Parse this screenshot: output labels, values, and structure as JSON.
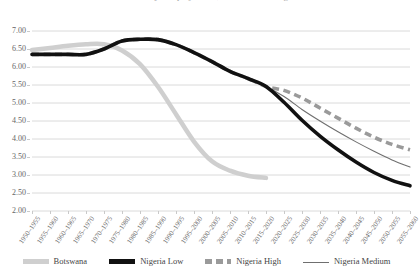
{
  "chart_data": {
    "type": "line",
    "title": "Total fertility rate projections, Botswana and Nigeria",
    "xlabel": "",
    "ylabel": "",
    "grid": true,
    "legend_position": "bottom",
    "ylim": [
      2.0,
      7.0
    ],
    "ytick_step": 0.5,
    "ytick_labels": [
      "7.00",
      "6.50",
      "6.00",
      "5.50",
      "5.00",
      "4.50",
      "4.00",
      "3.50",
      "3.00",
      "2.50",
      "2.00"
    ],
    "ytick_values": [
      7.0,
      6.5,
      6.0,
      5.5,
      5.0,
      4.5,
      4.0,
      3.5,
      3.0,
      2.5,
      2.0
    ],
    "categories": [
      "1950–1955",
      "1955–1960",
      "1960–1965",
      "1965–1970",
      "1970–1975",
      "1975–1980",
      "1980–1985",
      "1985–1990",
      "1990–1995",
      "1995–2000",
      "2000–2005",
      "2005–2010",
      "2010–2015",
      "2015–2020",
      "2020–2025",
      "2025–2030",
      "2030–2035",
      "2035–2040",
      "2040–2045",
      "2045–2050",
      "2050–2055",
      "2055–2060"
    ],
    "series": [
      {
        "name": "Botswana",
        "color": "#cfcfcf",
        "style": "solid-thick",
        "width": 4.5,
        "values": [
          6.47,
          6.53,
          6.59,
          6.63,
          6.63,
          6.46,
          6.08,
          5.45,
          4.69,
          3.93,
          3.38,
          3.12,
          2.98,
          2.92,
          null,
          null,
          null,
          null,
          null,
          null,
          null,
          null
        ]
      },
      {
        "name": "Nigeria Low",
        "color": "#111111",
        "style": "solid-thick",
        "width": 3.6,
        "values": [
          6.35,
          6.35,
          6.35,
          6.35,
          6.5,
          6.72,
          6.77,
          6.76,
          6.62,
          6.4,
          6.15,
          5.88,
          5.68,
          5.46,
          5.02,
          4.52,
          4.08,
          3.7,
          3.36,
          3.07,
          2.85,
          2.7
        ]
      },
      {
        "name": "Nigeria High",
        "color": "#9a9a9a",
        "style": "dashed-thick",
        "width": 3.6,
        "values": [
          6.35,
          6.35,
          6.35,
          6.35,
          6.5,
          6.72,
          6.77,
          6.76,
          6.62,
          6.4,
          6.15,
          5.88,
          5.68,
          5.46,
          5.35,
          5.14,
          4.86,
          4.58,
          4.3,
          4.05,
          3.85,
          3.7
        ]
      },
      {
        "name": "Nigeria Medium",
        "color": "#6f6f6f",
        "style": "solid-thin",
        "width": 1.1,
        "values": [
          6.35,
          6.35,
          6.35,
          6.35,
          6.5,
          6.72,
          6.77,
          6.76,
          6.62,
          6.4,
          6.15,
          5.88,
          5.68,
          5.46,
          5.18,
          4.82,
          4.5,
          4.2,
          3.92,
          3.66,
          3.42,
          3.22
        ]
      }
    ]
  },
  "legend": {
    "items": [
      {
        "label": "Botswana"
      },
      {
        "label": "Nigeria Low"
      },
      {
        "label": "Nigeria High"
      },
      {
        "label": "Nigeria Medium"
      }
    ]
  }
}
